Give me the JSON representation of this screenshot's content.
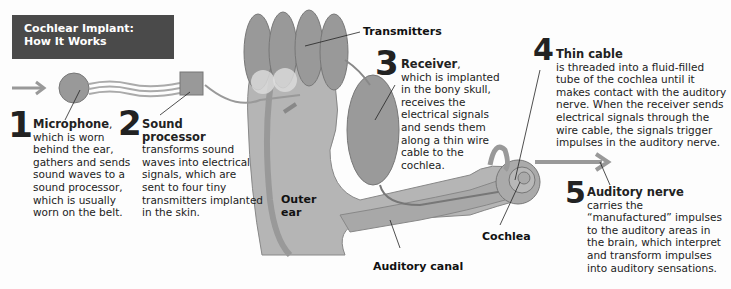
{
  "title": {
    "line1": "Cochlear Implant:",
    "line2": "How It Works"
  },
  "steps": [
    {
      "number": "1",
      "heading": "Microphone",
      "heading_suffix": ",",
      "lines": [
        "which is worn",
        "behind the ear,",
        "gathers and sends",
        "sound waves to a",
        "sound processor,",
        "which is usually",
        "worn on the belt."
      ]
    },
    {
      "number": "2",
      "heading_lines": [
        "Sound",
        "processor"
      ],
      "lines": [
        "transforms sound",
        "waves into electrical",
        "signals, which are",
        "sent to four tiny",
        "transmitters implanted",
        "in the skin."
      ]
    },
    {
      "number": "3",
      "heading": "Receiver",
      "heading_suffix": ",",
      "lines": [
        "which is implanted",
        "in the bony skull,",
        "receives the",
        "electrical signals",
        "and sends them",
        "along a thin wire",
        "cable to the",
        "cochlea."
      ]
    },
    {
      "number": "4",
      "heading": "Thin cable",
      "lines": [
        "is threaded into a fluid-filled",
        "tube of the cochlea until it",
        "makes contact with the auditory",
        "nerve. When the receiver sends",
        "electrical signals through the",
        "wire cable, the signals trigger",
        "impulses in the auditory nerve."
      ]
    },
    {
      "number": "5",
      "heading": "Auditory nerve",
      "lines": [
        "carries the",
        "“manufactured” impulses",
        "to the auditory areas in",
        "the brain, which interpret",
        "and transform impulses",
        "into auditory sensations."
      ]
    }
  ],
  "labels": {
    "transmitters": "Transmitters",
    "outer_ear": [
      "Outer",
      "ear"
    ],
    "cochlea": "Cochlea",
    "auditory_canal": "Auditory canal"
  },
  "colors": {
    "title_bg": "#4a4a4a",
    "tissue": "#a3a3a3",
    "device": "#8a8a8a",
    "background": "#fdfdfd"
  }
}
